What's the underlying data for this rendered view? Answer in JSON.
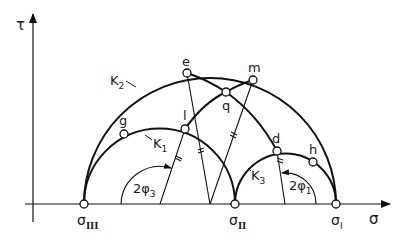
{
  "diagram": {
    "axes": {
      "y_label": "τ",
      "x_label": "σ"
    },
    "circles": [
      {
        "id": "K1",
        "label": "K",
        "sub": "1"
      },
      {
        "id": "K2",
        "label": "K",
        "sub": "2"
      },
      {
        "id": "K3",
        "label": "K",
        "sub": "3"
      }
    ],
    "points": [
      {
        "id": "e",
        "label": "e"
      },
      {
        "id": "m",
        "label": "m"
      },
      {
        "id": "q",
        "label": "q"
      },
      {
        "id": "g",
        "label": "g"
      },
      {
        "id": "l",
        "label": "l"
      },
      {
        "id": "d",
        "label": "d"
      },
      {
        "id": "h",
        "label": "h"
      }
    ],
    "axis_points": [
      {
        "id": "sigma3",
        "label": "σ",
        "sub": "III"
      },
      {
        "id": "sigma2",
        "label": "σ",
        "sub": "II"
      },
      {
        "id": "sigma1",
        "label": "σ",
        "sub": "I"
      }
    ],
    "angles": [
      {
        "id": "phi3",
        "label": "2φ",
        "sub": "3"
      },
      {
        "id": "phi1",
        "label": "2φ",
        "sub": "1"
      }
    ]
  }
}
